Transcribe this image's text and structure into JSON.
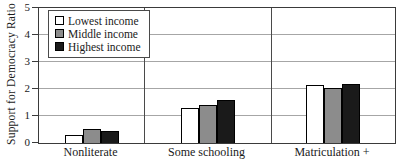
{
  "chart_data": {
    "type": "bar",
    "title": "",
    "ylabel": "Support for Democracy Ratio",
    "xlabel": "",
    "categories": [
      "Nonliterate",
      "Some schooling",
      "Matriculation +"
    ],
    "series": [
      {
        "name": "Lowest income",
        "color": "#ffffff",
        "values": [
          0.3,
          1.3,
          2.15
        ]
      },
      {
        "name": "Middle income",
        "color": "#8c8c8c",
        "values": [
          0.5,
          1.4,
          2.05
        ]
      },
      {
        "name": "Highest income",
        "color": "#1a1a1a",
        "values": [
          0.45,
          1.6,
          2.2
        ]
      }
    ],
    "ylim": [
      0,
      5
    ],
    "yticks": [
      0,
      1,
      2,
      3,
      4,
      5
    ],
    "grid": true,
    "legend_position": "top-left",
    "panel_separators": true
  },
  "colors": {
    "background": "#ffffff",
    "frame": "#3a3a3a",
    "gridline": "#a6a6a6",
    "separator": "#4a4a4a",
    "text": "#1a1a1a"
  }
}
